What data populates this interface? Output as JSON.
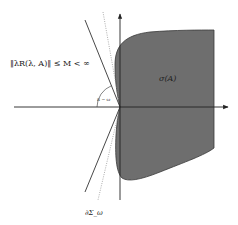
{
  "diagram": {
    "labels": {
      "resolvent_bound": "‖λR(λ, A)‖ ≤ M < ∞",
      "spectrum": "σ(A)",
      "angle": "π − ω",
      "sector_boundary": "∂Σ_ω"
    },
    "colors": {
      "background": "#ffffff",
      "spectrum_fill": "#6e6e6e",
      "spectrum_stroke": "#3a3a3a",
      "axis": "#222222",
      "sector_line": "#333333",
      "dotted_line": "#888888"
    },
    "axes": {
      "origin": [
        120,
        107
      ],
      "x_axis": {
        "from": [
          14,
          107
        ],
        "to": [
          228,
          107
        ],
        "arrow": "right"
      },
      "y_axis": {
        "from": [
          120,
          200
        ],
        "to": [
          120,
          14
        ],
        "arrow": "up"
      }
    },
    "sector_lines": [
      {
        "from": [
          85,
          20
        ],
        "to": [
          120,
          107
        ]
      },
      {
        "from": [
          120,
          107
        ],
        "to": [
          85,
          192
        ]
      }
    ],
    "dotted_boundary": [
      {
        "from": [
          103,
          12
        ],
        "to": [
          120,
          107
        ]
      },
      {
        "from": [
          120,
          107
        ],
        "to": [
          98,
          200
        ]
      }
    ]
  }
}
